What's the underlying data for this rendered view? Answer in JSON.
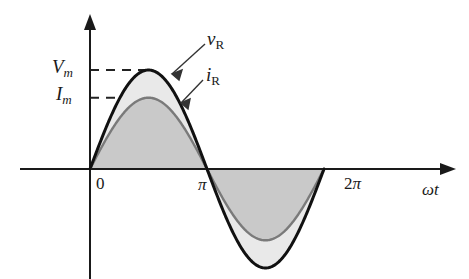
{
  "figure": {
    "background_color": "#ffffff",
    "curve_color_voltage": "#111111",
    "curve_color_current": "#7a7a7a",
    "fill_color_voltage_region": "#e9e9e9",
    "fill_color_current_region": "#c9c9c9",
    "axis_color": "#1a1a1a"
  },
  "labels": {
    "v_peak": {
      "base": "V",
      "sub": "m"
    },
    "i_peak": {
      "base": "I",
      "sub": "m"
    },
    "voltage_curve": {
      "base": "v",
      "sub": "R"
    },
    "current_curve": {
      "base": "i",
      "sub": "R"
    },
    "x_origin": "0",
    "x_pi": "π",
    "x_2pi_num": "2",
    "x_2pi_sym": "π",
    "x_axis_title_omega": "ω",
    "x_axis_title_t": "t"
  },
  "chart_data": {
    "type": "line",
    "title": "",
    "xlabel": "ωt",
    "ylabel": "",
    "xlim": [
      -0.25,
      7.6
    ],
    "ylim": [
      -1.18,
      1.18
    ],
    "xticks": [
      0,
      3.14159,
      6.28319
    ],
    "xticklabels": [
      "0",
      "π",
      "2π"
    ],
    "yticks": [
      0.72,
      1.0
    ],
    "yticklabels": [
      "I_m",
      "V_m"
    ],
    "grid": false,
    "legend": "annotations",
    "annotations": [
      {
        "text": "v_R",
        "target_x": 2.0,
        "target_y": 0.94,
        "label_x": 2.95,
        "label_y": 1.45
      },
      {
        "text": "i_R",
        "target_x": 2.35,
        "target_y": 0.58,
        "label_x": 2.95,
        "label_y": 1.08
      },
      {
        "text": "V_m",
        "type": "dashed-level",
        "y": 1.0
      },
      {
        "text": "I_m",
        "type": "dashed-level",
        "y": 0.72
      }
    ],
    "series": [
      {
        "name": "v_R",
        "formula": "V_m * sin(wt)",
        "amplitude": 1.0,
        "color": "#111111",
        "linewidth": 2.6,
        "x": [
          0,
          0.3927,
          0.7854,
          1.1781,
          1.5708,
          1.9635,
          2.3562,
          2.7489,
          3.1416,
          3.5343,
          3.927,
          4.3197,
          4.7124,
          5.1051,
          5.4978,
          5.8905,
          6.2832
        ],
        "y": [
          0.0,
          0.3827,
          0.7071,
          0.9239,
          1.0,
          0.9239,
          0.7071,
          0.3827,
          0.0,
          -0.3827,
          -0.7071,
          -0.9239,
          -1.0,
          -0.9239,
          -0.7071,
          -0.3827,
          0.0
        ]
      },
      {
        "name": "i_R",
        "formula": "I_m * sin(wt)",
        "amplitude": 0.72,
        "color": "#7a7a7a",
        "linewidth": 2.2,
        "x": [
          0,
          0.3927,
          0.7854,
          1.1781,
          1.5708,
          1.9635,
          2.3562,
          2.7489,
          3.1416,
          3.5343,
          3.927,
          4.3197,
          4.7124,
          5.1051,
          5.4978,
          5.8905,
          6.2832
        ],
        "y": [
          0.0,
          0.2755,
          0.5091,
          0.6652,
          0.72,
          0.6652,
          0.5091,
          0.2755,
          0.0,
          -0.2755,
          -0.5091,
          -0.6652,
          -0.72,
          -0.6652,
          -0.5091,
          -0.2755,
          0.0
        ]
      }
    ],
    "fills": [
      {
        "name": "between-voltage-and-current",
        "color": "#e9e9e9"
      },
      {
        "name": "under-current",
        "color": "#c9c9c9"
      }
    ]
  }
}
